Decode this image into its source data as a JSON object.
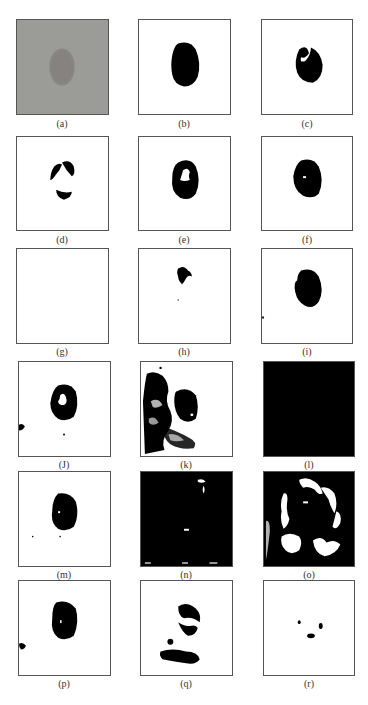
{
  "figure": {
    "panels": [
      {
        "id": "a",
        "label": "(a)",
        "description": "original grayscale lesion image"
      },
      {
        "id": "b",
        "label": "(b)",
        "description": "ground-truth segmentation mask"
      },
      {
        "id": "c",
        "label": "(c)",
        "description": "segmentation result"
      },
      {
        "id": "d",
        "label": "(d)",
        "description": "segmentation result"
      },
      {
        "id": "e",
        "label": "(e)",
        "description": "segmentation result"
      },
      {
        "id": "f",
        "label": "(f)",
        "description": "segmentation result"
      },
      {
        "id": "g",
        "label": "(g)",
        "description": "segmentation result (empty)"
      },
      {
        "id": "h",
        "label": "(h)",
        "description": "segmentation result"
      },
      {
        "id": "i",
        "label": "(i)",
        "description": "segmentation result"
      },
      {
        "id": "j",
        "label": "(J)",
        "description": "segmentation result"
      },
      {
        "id": "k",
        "label": "(k)",
        "description": "segmentation result (noisy)"
      },
      {
        "id": "l",
        "label": "(l)",
        "description": "segmentation result (all black)"
      },
      {
        "id": "m",
        "label": "(m)",
        "description": "segmentation result"
      },
      {
        "id": "n",
        "label": "(n)",
        "description": "segmentation result (mostly black)"
      },
      {
        "id": "o",
        "label": "(o)",
        "description": "segmentation result (noisy)"
      },
      {
        "id": "p",
        "label": "(p)",
        "description": "segmentation result"
      },
      {
        "id": "q",
        "label": "(q)",
        "description": "segmentation result (fragmented)"
      },
      {
        "id": "r",
        "label": "(r)",
        "description": "segmentation result (small fragments)"
      }
    ]
  }
}
